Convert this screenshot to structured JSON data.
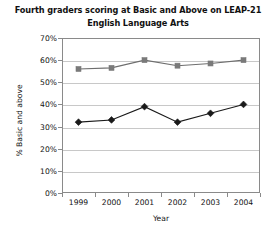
{
  "chart_data": {
    "type": "line",
    "title": "Fourth graders scoring at Basic and Above on LEAP-21 English Language Arts",
    "title_line1": "Fourth graders scoring at Basic and Above on LEAP-21",
    "title_line2": "English Language Arts",
    "xlabel": "Year",
    "ylabel": "% Basic and above",
    "categories": [
      "1999",
      "2000",
      "2001",
      "2002",
      "2003",
      "2004"
    ],
    "x": [
      1999,
      2000,
      2001,
      2002,
      2003,
      2004
    ],
    "ylim": [
      0,
      70
    ],
    "ytick_values": [
      0,
      10,
      20,
      30,
      40,
      50,
      60,
      70
    ],
    "ytick_labels": [
      "0%",
      "10%",
      "20%",
      "30%",
      "40%",
      "50%",
      "60%",
      "70%"
    ],
    "grid": true,
    "legend": false,
    "series": [
      {
        "name": "Basic and Above",
        "marker": "square",
        "color": "#7a7a7a",
        "line_color": "#6e6e6e",
        "values": [
          56,
          56.5,
          60,
          57.5,
          58.5,
          60
        ]
      },
      {
        "name": "Mastery and Above",
        "marker": "diamond",
        "color": "#1a1a1a",
        "line_color": "#1a1a1a",
        "values": [
          32,
          33,
          39,
          32,
          36,
          40
        ]
      }
    ]
  },
  "colors": {
    "background": "#ffffff",
    "frame": "#8a8a8a",
    "grid": "#c8c8c8",
    "text": "#111111",
    "series_square": "#7a7a7a",
    "series_diamond": "#1a1a1a"
  }
}
